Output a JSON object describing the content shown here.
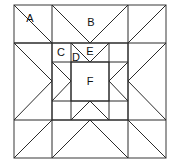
{
  "figure": {
    "name": "quilt-block-diagram",
    "type": "pieced quilt block line drawing",
    "background_color": "#ffffff",
    "line_color": "#2b2b2b",
    "outline_color": "#4a4a4a",
    "label_color": "#111111"
  },
  "block": {
    "outer_square": {
      "x": 14,
      "y": 5,
      "width": 152,
      "height": 153
    },
    "grid_x": [
      14,
      52,
      128,
      166
    ],
    "grid_y": [
      5,
      43,
      120,
      158
    ],
    "inner_square": {
      "x": 71,
      "y": 62,
      "width": 38,
      "height": 39
    },
    "middle_square": {
      "x": 52,
      "y": 43,
      "width": 76,
      "height": 77
    }
  },
  "labels": [
    {
      "id": "A",
      "text": "A",
      "x": 30,
      "y": 19
    },
    {
      "id": "B",
      "text": "B",
      "x": 91,
      "y": 23
    },
    {
      "id": "C",
      "text": "C",
      "x": 61,
      "y": 53
    },
    {
      "id": "D",
      "text": "D",
      "x": 76,
      "y": 58
    },
    {
      "id": "E",
      "text": "E",
      "x": 90,
      "y": 52
    },
    {
      "id": "F",
      "text": "F",
      "x": 90,
      "y": 82
    }
  ]
}
